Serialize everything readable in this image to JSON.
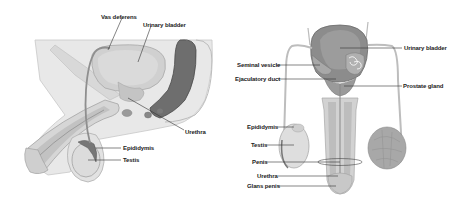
{
  "diagram": {
    "left_panel": {
      "view": "sagittal",
      "labels": [
        {
          "text": "Vas deferens",
          "x": 101,
          "y": 14
        },
        {
          "text": "Urinary bladder",
          "x": 143,
          "y": 22
        },
        {
          "text": "Urethra",
          "x": 185,
          "y": 129
        },
        {
          "text": "Epididymis",
          "x": 123,
          "y": 145
        },
        {
          "text": "Testis",
          "x": 123,
          "y": 157
        }
      ]
    },
    "right_panel": {
      "view": "frontal",
      "labels": [
        {
          "text": "Urinary bladder",
          "x": 404,
          "y": 47
        },
        {
          "text": "Seminal vesicle",
          "x": 237,
          "y": 63
        },
        {
          "text": "Ejaculatory duct",
          "x": 235,
          "y": 77
        },
        {
          "text": "Prostate gland",
          "x": 403,
          "y": 84
        },
        {
          "text": "Epididymis",
          "x": 247,
          "y": 125
        },
        {
          "text": "Testis",
          "x": 251,
          "y": 143
        },
        {
          "text": "Penis",
          "x": 251,
          "y": 160
        },
        {
          "text": "Urethra",
          "x": 257,
          "y": 174
        },
        {
          "text": "Glans penis",
          "x": 247,
          "y": 184
        }
      ]
    },
    "colors": {
      "tissue_light": "#e6e6e6",
      "tissue_mid": "#cfcfcf",
      "tissue_dark": "#8a8a8a",
      "rectum": "#6b6b6b",
      "leader_line": "#333333",
      "label_text": "#222222"
    }
  }
}
